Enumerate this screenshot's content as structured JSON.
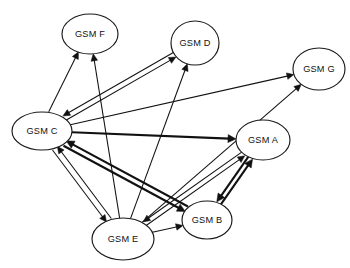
{
  "diagram": {
    "type": "directed-graph",
    "background_color": "#ffffff",
    "node_fill": "#ffffff",
    "node_stroke": "#1a1a1a",
    "edge_color": "#111111",
    "nodes": [
      {
        "id": "F",
        "label": "GSM F",
        "cx": 90,
        "cy": 34,
        "rx": 28,
        "ry": 20
      },
      {
        "id": "D",
        "label": "GSM D",
        "cx": 195,
        "cy": 43,
        "rx": 24,
        "ry": 22
      },
      {
        "id": "G",
        "label": "GSM G",
        "cx": 319,
        "cy": 69,
        "rx": 26,
        "ry": 21
      },
      {
        "id": "C",
        "label": "GSM C",
        "cx": 42,
        "cy": 131,
        "rx": 30,
        "ry": 19
      },
      {
        "id": "A",
        "label": "GSM A",
        "cx": 263,
        "cy": 140,
        "rx": 27,
        "ry": 20
      },
      {
        "id": "B",
        "label": "GSM B",
        "cx": 207,
        "cy": 220,
        "rx": 25,
        "ry": 19
      },
      {
        "id": "E",
        "label": "GSM E",
        "cx": 123,
        "cy": 239,
        "rx": 31,
        "ry": 21
      }
    ],
    "edges": [
      {
        "from": "C",
        "to": "F",
        "weight": "thin",
        "offset": -2.5
      },
      {
        "from": "E",
        "to": "F",
        "weight": "thin",
        "offset": 0
      },
      {
        "from": "C",
        "to": "D",
        "weight": "thin",
        "offset": 2.6
      },
      {
        "from": "D",
        "to": "C",
        "weight": "thin",
        "offset": 2.6
      },
      {
        "from": "E",
        "to": "D",
        "weight": "thin",
        "offset": 0
      },
      {
        "from": "C",
        "to": "G",
        "weight": "thin",
        "offset": 0
      },
      {
        "from": "E",
        "to": "G",
        "weight": "thin",
        "offset": 0
      },
      {
        "from": "C",
        "to": "A",
        "weight": "thick",
        "offset": 0
      },
      {
        "from": "C",
        "to": "B",
        "weight": "thick",
        "offset": 2.8
      },
      {
        "from": "B",
        "to": "C",
        "weight": "thick",
        "offset": 2.8
      },
      {
        "from": "C",
        "to": "E",
        "weight": "thin",
        "offset": 3.0
      },
      {
        "from": "E",
        "to": "C",
        "weight": "thin",
        "offset": 3.0
      },
      {
        "from": "E",
        "to": "A",
        "weight": "thin",
        "offset": 2.4
      },
      {
        "from": "A",
        "to": "E",
        "weight": "thin",
        "offset": 2.4
      },
      {
        "from": "E",
        "to": "B",
        "weight": "thin",
        "offset": 0
      },
      {
        "from": "A",
        "to": "B",
        "weight": "thick",
        "offset": 2.4
      },
      {
        "from": "B",
        "to": "A",
        "weight": "thick",
        "offset": 2.4
      }
    ]
  }
}
